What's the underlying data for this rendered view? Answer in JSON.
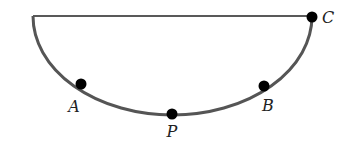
{
  "diagram": {
    "line_color": "#222222",
    "arc_color": "#555555",
    "point_color": "#000000",
    "diameter": {
      "x1": 33,
      "y1": 16,
      "x2": 312,
      "y2": 16
    },
    "arc": {
      "cx": 172.5,
      "cy": 16,
      "rx": 139.5,
      "ry": 99
    },
    "points": [
      {
        "name": "A",
        "label": "A",
        "x": 81,
        "y": 84,
        "lx": 74,
        "ly": 112
      },
      {
        "name": "P",
        "label": "P",
        "x": 172,
        "y": 114,
        "lx": 172,
        "ly": 137
      },
      {
        "name": "B",
        "label": "B",
        "x": 264,
        "y": 86,
        "lx": 268,
        "ly": 111
      },
      {
        "name": "C",
        "label": "C",
        "x": 312,
        "y": 17,
        "lx": 328,
        "ly": 23
      }
    ]
  }
}
